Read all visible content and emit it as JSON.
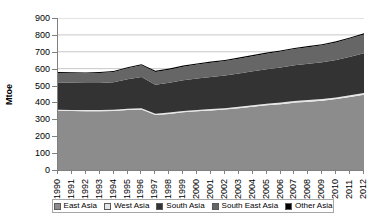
{
  "chart_data": {
    "type": "area",
    "stacked": true,
    "title": "",
    "xlabel": "",
    "ylabel": "Mtoe",
    "ylim": [
      0,
      900
    ],
    "ytick_step": 100,
    "yticks": [
      900,
      800,
      700,
      600,
      500,
      400,
      300,
      200,
      100,
      0
    ],
    "grid": true,
    "legend_position": "bottom",
    "categories": [
      "1990",
      "1991",
      "1992",
      "1993",
      "1994",
      "1995",
      "1996",
      "1997",
      "1998",
      "1999",
      "2000",
      "2001",
      "2002",
      "2003",
      "2004",
      "2005",
      "2006",
      "2007",
      "2008",
      "2009",
      "2010",
      "2011",
      "2012"
    ],
    "series": [
      {
        "name": "East Asia",
        "color": "#8c8c8c",
        "values": [
          350,
          349,
          348,
          348,
          350,
          355,
          358,
          325,
          332,
          342,
          348,
          353,
          358,
          366,
          375,
          383,
          390,
          398,
          404,
          410,
          420,
          432,
          445
        ]
      },
      {
        "name": "West Asia",
        "color": "#e6e6e6",
        "values": [
          7,
          7,
          7,
          7,
          7,
          7,
          7,
          8,
          8,
          8,
          8,
          8,
          8,
          9,
          9,
          9,
          9,
          10,
          10,
          10,
          10,
          11,
          11
        ]
      },
      {
        "name": "South Asia",
        "color": "#333333",
        "values": [
          160,
          160,
          160,
          160,
          162,
          175,
          185,
          172,
          176,
          182,
          186,
          190,
          193,
          196,
          200,
          205,
          208,
          212,
          215,
          218,
          222,
          228,
          235
        ]
      },
      {
        "name": "South East Asia",
        "color": "#666666",
        "values": [
          58,
          58,
          58,
          60,
          62,
          65,
          70,
          75,
          78,
          80,
          82,
          84,
          86,
          88,
          90,
          92,
          94,
          96,
          98,
          100,
          103,
          107,
          112
        ]
      },
      {
        "name": "Other Asia",
        "color": "#000000",
        "values": [
          5,
          5,
          5,
          5,
          5,
          6,
          6,
          7,
          7,
          7,
          7,
          7,
          7,
          7,
          7,
          7,
          7,
          7,
          7,
          7,
          7,
          7,
          7
        ]
      }
    ],
    "totals": [
      580,
      579,
      578,
      580,
      586,
      608,
      626,
      587,
      601,
      619,
      631,
      642,
      652,
      666,
      681,
      696,
      708,
      723,
      734,
      745,
      762,
      785,
      810
    ]
  },
  "legend": {
    "items": [
      {
        "label": "East Asia"
      },
      {
        "label": "West Asia"
      },
      {
        "label": "South Asia"
      },
      {
        "label": "South East Asia"
      },
      {
        "label": "Other Asia"
      }
    ]
  },
  "axes": {
    "y_title": "Mtoe"
  }
}
